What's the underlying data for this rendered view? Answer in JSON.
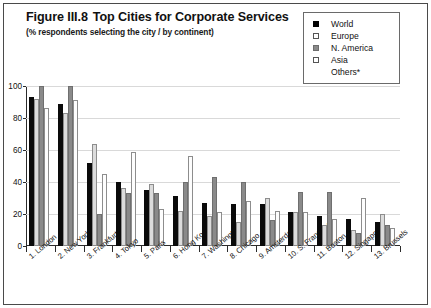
{
  "figure": {
    "title_number": "Figure III.8",
    "title_text": "Top Cities for Corporate Services",
    "subtitle": "(% respondents selecting the city / by continent)"
  },
  "legend": {
    "items": [
      {
        "label": "World",
        "swatch": "black-square-icon",
        "color": "#000000"
      },
      {
        "label": "Europe",
        "swatch": "white-square-icon",
        "color": "#dcdcdc"
      },
      {
        "label": "N. America",
        "swatch": "gray-square-icon",
        "color": "#8a8a8a"
      },
      {
        "label": "Asia",
        "swatch": "white-square-icon",
        "color": "#ffffff"
      }
    ],
    "footnote": "Others*"
  },
  "chart_data": {
    "type": "bar",
    "subtitle": "(% respondents selecting the city / by continent)",
    "xlabel": "",
    "ylabel": "",
    "ylim": [
      0,
      100
    ],
    "yticks": [
      0,
      20,
      40,
      60,
      80,
      100
    ],
    "grid": true,
    "legend_position": "top-right",
    "categories": [
      "1. London",
      "2. New York",
      "3. Frankfurt",
      "4. Tokyo",
      "5. Paris",
      "6. Hong Kong",
      "7. Washington",
      "8. Chicago",
      "9. Amsterdam",
      "10. S. Francisco",
      "11. Boston",
      "12. Singapore",
      "13. Brussels"
    ],
    "series": [
      {
        "name": "World",
        "color": "#000000",
        "values": [
          93,
          89,
          52,
          40,
          35,
          31,
          27,
          26,
          26,
          21,
          19,
          17,
          15
        ]
      },
      {
        "name": "Europe",
        "color": "#dcdcdc",
        "values": [
          92,
          83,
          64,
          36,
          39,
          22,
          19,
          15,
          30,
          21,
          13,
          10,
          20
        ]
      },
      {
        "name": "N. America",
        "color": "#8a8a8a",
        "values": [
          100,
          100,
          20,
          33,
          33,
          40,
          43,
          40,
          16,
          34,
          34,
          8,
          13
        ]
      },
      {
        "name": "Asia",
        "color": "#ffffff",
        "values": [
          86,
          91,
          45,
          59,
          23,
          56,
          21,
          28,
          22,
          21,
          17,
          30,
          11
        ]
      }
    ]
  }
}
